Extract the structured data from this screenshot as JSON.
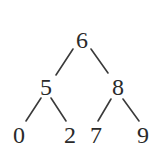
{
  "diagram": {
    "type": "binary-tree",
    "nodes": {
      "root": "6",
      "left": "5",
      "right": "8",
      "left_left": "0",
      "left_right": "2",
      "right_left": "7",
      "right_right": "9"
    },
    "edges": [
      [
        "6",
        "5"
      ],
      [
        "6",
        "8"
      ],
      [
        "5",
        "0"
      ],
      [
        "5",
        "2"
      ],
      [
        "8",
        "7"
      ],
      [
        "8",
        "9"
      ]
    ]
  }
}
